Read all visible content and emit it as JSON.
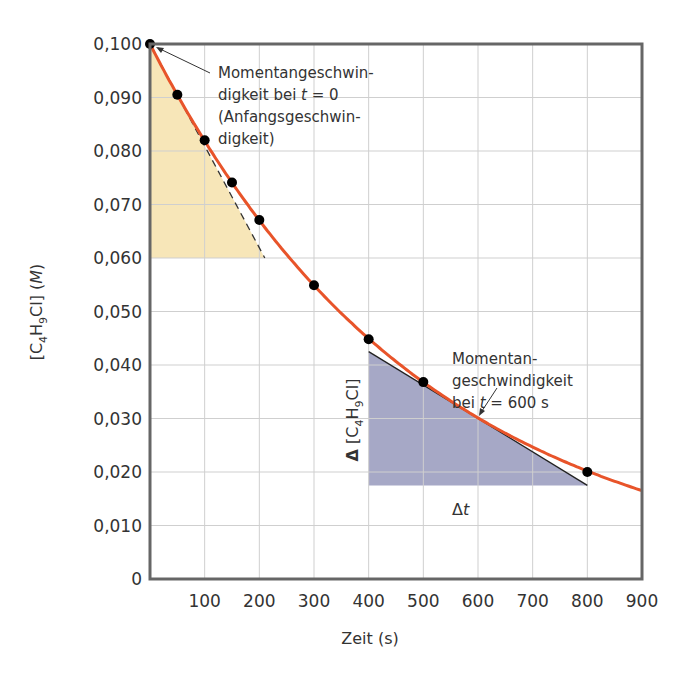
{
  "chart_data": {
    "type": "line",
    "title": "",
    "xlabel": "Zeit (s)",
    "ylabel": "[C4H9Cl] (M)",
    "ylabel_parts": {
      "open": "[C",
      "sub1": "4",
      "mid": "H",
      "sub2": "9",
      "close": "Cl] (",
      "unit": "M",
      "end": ")"
    },
    "xlim": [
      0,
      900
    ],
    "ylim": [
      0,
      0.1
    ],
    "grid": true,
    "x_ticks": [
      100,
      200,
      300,
      400,
      500,
      600,
      700,
      800,
      900
    ],
    "x_tick_labels": [
      "100",
      "200",
      "300",
      "400",
      "500",
      "600",
      "700",
      "800",
      "900"
    ],
    "y_ticks": [
      0,
      0.01,
      0.02,
      0.03,
      0.04,
      0.05,
      0.06,
      0.07,
      0.08,
      0.09,
      0.1
    ],
    "y_tick_labels": [
      "0",
      "0,010",
      "0,020",
      "0,030",
      "0,040",
      "0,050",
      "0,060",
      "0,070",
      "0,080",
      "0,090",
      "0,100"
    ],
    "series": [
      {
        "name": "[C4H9Cl] measured",
        "type": "scatter",
        "x": [
          0,
          50,
          100,
          150,
          200,
          300,
          400,
          500,
          800
        ],
        "y": [
          0.1,
          0.0905,
          0.082,
          0.0741,
          0.0671,
          0.0549,
          0.0448,
          0.0368,
          0.02
        ],
        "color": "#000000"
      },
      {
        "name": "fitted curve",
        "type": "line",
        "function": "0.1*exp(-0.002*t)",
        "x": [
          0,
          100,
          200,
          300,
          400,
          500,
          600,
          700,
          800,
          900
        ],
        "y": [
          0.1,
          0.0819,
          0.067,
          0.0549,
          0.0449,
          0.0368,
          0.0301,
          0.0247,
          0.0202,
          0.0165
        ],
        "color": "#e8542a"
      }
    ],
    "tangents": [
      {
        "name": "initial-rate-tangent",
        "style": "dashed",
        "from": [
          0,
          0.1
        ],
        "to": [
          210,
          0.06
        ],
        "color": "#333333"
      },
      {
        "name": "rate-at-600s-tangent",
        "style": "solid",
        "from": [
          400,
          0.0425
        ],
        "to": [
          800,
          0.0175
        ],
        "color": "#222222"
      }
    ],
    "shaded_regions": [
      {
        "name": "initial-rate-triangle",
        "polygon": [
          [
            0,
            0.1
          ],
          [
            0,
            0.06
          ],
          [
            210,
            0.06
          ]
        ],
        "color": "#f7e6b8"
      },
      {
        "name": "rate-600s-triangle",
        "polygon": [
          [
            400,
            0.0425
          ],
          [
            400,
            0.0175
          ],
          [
            800,
            0.0175
          ]
        ],
        "color": "#a6a8c6"
      }
    ],
    "annotations": [
      {
        "lines": [
          "Momentangeschwin-",
          "digkeit bei t = 0",
          "(Anfangsgeschwin-",
          "digkeit)"
        ],
        "points_to": [
          0,
          0.1
        ]
      },
      {
        "lines": [
          "Momentan-",
          "geschwindigkeit",
          "bei t = 600 s"
        ],
        "points_to": [
          600,
          0.0301
        ]
      },
      {
        "text": "Δ [C4H9Cl]",
        "orientation": "vertical"
      },
      {
        "text": "Δt"
      }
    ]
  },
  "annotations": {
    "a1": {
      "l1": "Momentangeschwin-",
      "l2a": "digkeit bei ",
      "l2t": "t",
      "l2b": " = 0",
      "l3": "(Anfangsgeschwin-",
      "l4": "digkeit)"
    },
    "a2": {
      "l1": "Momentan-",
      "l2": "geschwindigkeit",
      "l3a": "bei ",
      "l3t": "t",
      "l3b": " = 600 s"
    },
    "delta_c": {
      "delta": "Δ",
      "open": " [C",
      "sub1": "4",
      "mid": "H",
      "sub2": "9",
      "close": "Cl]"
    },
    "delta_t": {
      "delta": "Δ",
      "t": "t"
    }
  }
}
